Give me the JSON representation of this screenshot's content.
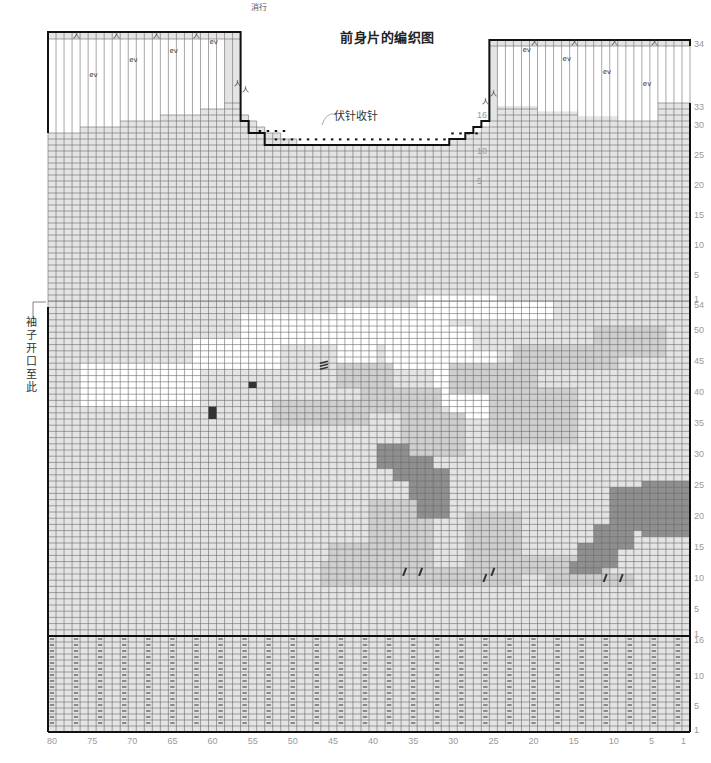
{
  "title": "前身片的编织图",
  "bindoff_note": "伏针收针",
  "side_note": "袖子开口至此",
  "shoulder_note": "消行",
  "footer_note": "7 指 1 了 t 一 下 指 行 条 排 行 文",
  "colors": {
    "background_stitch": "#e4e4e4",
    "white_region": "#ffffff",
    "light_grey_region": "#cfcfcf",
    "mid_grey_region": "#bdbdbd",
    "dark_grey_region": "#8f8f8f",
    "grid_line": "#6a6a6a",
    "outline": "#111111",
    "label": "#999999"
  },
  "grid": {
    "columns": 80,
    "left_x": 48,
    "right_x": 690,
    "ribbing": {
      "rows": 16,
      "bottom_y": 732,
      "row_h": 6.0
    },
    "body": {
      "rows": 54,
      "bottom_y": 636,
      "row_h": 6.2
    },
    "upper": {
      "rows": 33,
      "bottom_y": 301,
      "row_h": 6.0
    }
  },
  "column_labels": [
    "80",
    "75",
    "70",
    "65",
    "60",
    "55",
    "50",
    "45",
    "40",
    "35",
    "30",
    "25",
    "20",
    "15",
    "10",
    "5",
    "1"
  ],
  "column_label_values": [
    80,
    75,
    70,
    65,
    60,
    55,
    50,
    45,
    40,
    35,
    30,
    25,
    20,
    15,
    10,
    5,
    1
  ],
  "row_labels_ribbing": [
    {
      "text": "1",
      "row": 1
    },
    {
      "text": "5",
      "row": 5
    },
    {
      "text": "10",
      "row": 10
    },
    {
      "text": "16",
      "row": 16
    }
  ],
  "row_labels_body": [
    {
      "text": "1",
      "row": 1
    },
    {
      "text": "5",
      "row": 5
    },
    {
      "text": "10",
      "row": 10
    },
    {
      "text": "15",
      "row": 15
    },
    {
      "text": "20",
      "row": 20
    },
    {
      "text": "25",
      "row": 25
    },
    {
      "text": "30",
      "row": 30
    },
    {
      "text": "35",
      "row": 35
    },
    {
      "text": "40",
      "row": 40
    },
    {
      "text": "45",
      "row": 45
    },
    {
      "text": "50",
      "row": 50
    },
    {
      "text": "54",
      "row": 54
    }
  ],
  "row_labels_upper": [
    {
      "text": "1",
      "row": 1
    },
    {
      "text": "5",
      "row": 5
    },
    {
      "text": "10",
      "row": 10
    },
    {
      "text": "15",
      "row": 15
    },
    {
      "text": "20",
      "row": 20
    },
    {
      "text": "25",
      "row": 25
    },
    {
      "text": "30",
      "row": 30
    },
    {
      "text": "33",
      "row": 33
    },
    {
      "text": "34",
      "row": 34
    }
  ],
  "neck_row_labels": [
    {
      "text": "5",
      "row": 21
    },
    {
      "text": "10",
      "row": 26
    },
    {
      "text": "16",
      "row": 32
    }
  ],
  "ribbing_symbol": "—",
  "shaping_symbols": {
    "decrease": "人",
    "slip_turn": "ev"
  },
  "shape": {
    "left_shoulder_top_cols": [
      57,
      80
    ],
    "right_shoulder_top_cols": [
      1,
      25
    ],
    "neck_bottom_cols": [
      31,
      49
    ],
    "neck_bottom_row": 27
  },
  "regions": [
    {
      "tone": "white",
      "cells": [
        [
          62,
          38,
          76,
          44
        ],
        [
          52,
          44,
          62,
          48
        ],
        [
          37,
          48,
          56,
          52
        ],
        [
          31,
          50,
          44,
          53
        ],
        [
          25,
          52,
          34,
          55
        ],
        [
          18,
          52,
          25,
          54
        ],
        [
          28,
          46,
          37,
          50
        ],
        [
          25,
          38,
          32,
          46
        ],
        [
          26,
          36,
          30,
          38
        ],
        [
          40,
          45,
          44,
          48
        ],
        [
          32,
          44,
          38,
          48
        ]
      ]
    },
    {
      "tone": "light",
      "cells": [
        [
          41,
          35,
          52,
          38
        ],
        [
          32,
          37,
          41,
          40
        ],
        [
          20,
          40,
          30,
          44
        ],
        [
          10,
          44,
          22,
          47
        ],
        [
          4,
          46,
          12,
          50
        ],
        [
          38,
          41,
          44,
          44
        ],
        [
          15,
          32,
          25,
          40
        ],
        [
          29,
          30,
          36,
          36
        ],
        [
          34,
          9,
          46,
          12
        ],
        [
          22,
          9,
          34,
          11
        ],
        [
          8,
          9,
          18,
          10
        ],
        [
          33,
          12,
          45,
          15
        ],
        [
          33,
          15,
          40,
          22
        ],
        [
          22,
          12,
          28,
          20
        ],
        [
          11,
          11,
          22,
          13
        ],
        [
          24,
          17,
          28,
          20
        ]
      ]
    },
    {
      "tone": "dark",
      "cells": [
        [
          36,
          28,
          39,
          31
        ],
        [
          33,
          26,
          37,
          29
        ],
        [
          31,
          23,
          35,
          27
        ],
        [
          31,
          20,
          34,
          23
        ],
        [
          1,
          17,
          6,
          25
        ],
        [
          6,
          18,
          10,
          24
        ],
        [
          8,
          15,
          12,
          18
        ],
        [
          10,
          12,
          14,
          15
        ],
        [
          12,
          11,
          15,
          12
        ]
      ]
    }
  ],
  "marks": [
    {
      "type": "block",
      "col": 60,
      "row": 37,
      "w": 1,
      "h": 2
    },
    {
      "type": "block",
      "col": 55,
      "row": 41,
      "w": 1,
      "h": 1
    },
    {
      "type": "slash_group",
      "col": 46,
      "row": 44
    },
    {
      "type": "slash",
      "col": 36,
      "row": 11
    },
    {
      "type": "slash",
      "col": 34,
      "row": 11
    },
    {
      "type": "slash",
      "col": 26,
      "row": 10
    },
    {
      "type": "slash",
      "col": 25,
      "row": 11
    },
    {
      "type": "slash",
      "col": 11,
      "row": 10
    },
    {
      "type": "slash",
      "col": 9,
      "row": 10
    }
  ]
}
